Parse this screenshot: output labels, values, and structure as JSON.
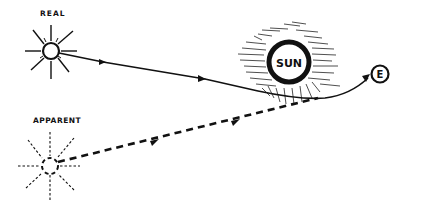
{
  "diagram": {
    "labels": {
      "real": "REAL",
      "apparent": "APPARENT",
      "sun": "SUN",
      "earth": "E"
    },
    "elements": [
      {
        "id": "real-star",
        "label": "REAL",
        "style": "solid rays"
      },
      {
        "id": "apparent-star",
        "label": "APPARENT",
        "style": "dashed rays"
      },
      {
        "id": "sun",
        "label": "SUN",
        "style": "circle with corona hatching"
      },
      {
        "id": "earth",
        "label": "E",
        "style": "small circle"
      }
    ],
    "paths": [
      {
        "from": "real-star",
        "to": "earth",
        "style": "solid",
        "note": "light bends around the sun"
      },
      {
        "from": "apparent-star",
        "to": "sun-edge",
        "style": "dashed",
        "note": "apparent line of sight"
      }
    ],
    "colors": {
      "ink": "#111111",
      "background": "#ffffff"
    }
  }
}
